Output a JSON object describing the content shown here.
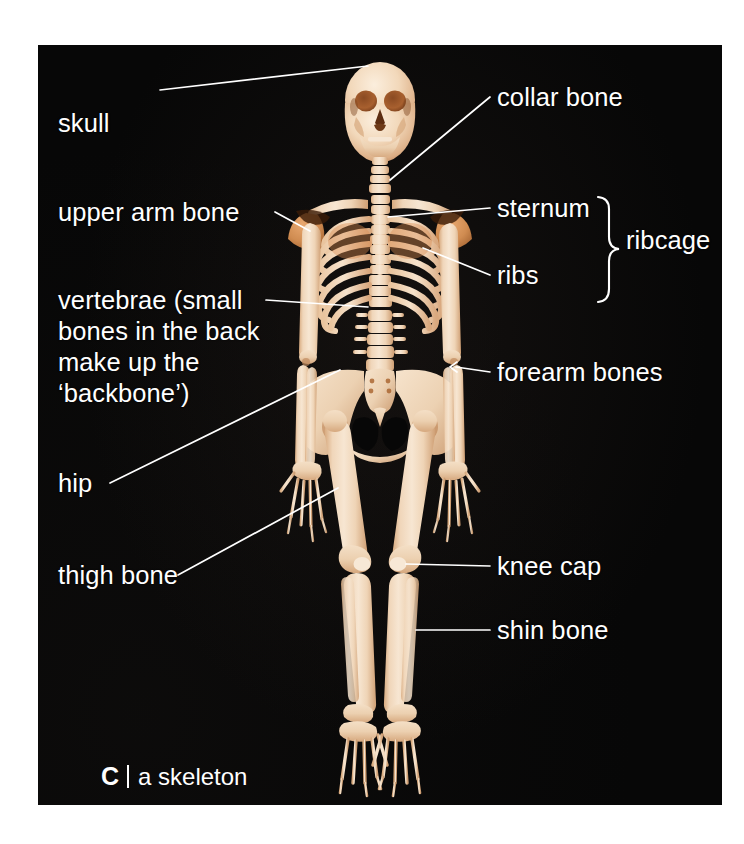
{
  "figure": {
    "kind": "anatomy-photo-diagram",
    "panel_background": "#070707",
    "label_color": "#ffffff",
    "bone_color": "#f2d9bd",
    "bone_shadow_color": "#c08a5e",
    "caption": {
      "letter": "C",
      "separator": "|",
      "text": "a skeleton"
    }
  },
  "labels": {
    "skull": "skull",
    "upper_arm_bone": "upper arm bone",
    "vertebrae": "vertebrae (small bones in the back make up the ‘backbone’)",
    "hip": "hip",
    "thigh_bone": "thigh bone",
    "collar_bone": "collar bone",
    "sternum": "sternum",
    "ribs": "ribs",
    "ribcage": "ribcage",
    "forearm_bones": "forearm bones",
    "knee_cap": "knee cap",
    "shin_bone": "shin bone"
  },
  "annotations": [
    {
      "id": "skull",
      "label": "skull",
      "side": "left",
      "x": 58,
      "y": 78,
      "target_x": 367,
      "target_y": 60
    },
    {
      "id": "upper-arm-bone",
      "label": "upper arm bone",
      "side": "left",
      "x": 58,
      "y": 200,
      "target_x": 305,
      "target_y": 227
    },
    {
      "id": "vertebrae",
      "label": "vertebrae (small bones in the back make up the ‘backbone’)",
      "side": "left",
      "x": 58,
      "y": 287,
      "target_x": 360,
      "target_y": 300
    },
    {
      "id": "hip",
      "label": "hip",
      "side": "left",
      "x": 58,
      "y": 478,
      "target_x": 345,
      "target_y": 368
    },
    {
      "id": "thigh-bone",
      "label": "thigh bone",
      "side": "left",
      "x": 58,
      "y": 570,
      "target_x": 337,
      "target_y": 485
    },
    {
      "id": "collar-bone",
      "label": "collar bone",
      "side": "right",
      "x": 497,
      "y": 85,
      "target_x": 383,
      "target_y": 170
    },
    {
      "id": "sternum",
      "label": "sternum",
      "side": "right",
      "x": 497,
      "y": 196,
      "target_x": 390,
      "target_y": 212
    },
    {
      "id": "ribs",
      "label": "ribs",
      "side": "right",
      "x": 497,
      "y": 263,
      "target_x": 419,
      "target_y": 236
    },
    {
      "id": "ribcage",
      "label": "ribcage",
      "side": "right",
      "x": 626,
      "y": 228,
      "target_x": 0,
      "target_y": 0
    },
    {
      "id": "forearm-bones",
      "label": "forearm bones",
      "side": "right",
      "x": 497,
      "y": 360,
      "target_x": 454,
      "target_y": 365
    },
    {
      "id": "knee-cap",
      "label": "knee cap",
      "side": "right",
      "x": 497,
      "y": 554,
      "target_x": 420,
      "target_y": 562
    },
    {
      "id": "shin-bone",
      "label": "shin bone",
      "side": "right",
      "x": 497,
      "y": 618,
      "target_x": 418,
      "target_y": 620
    }
  ],
  "brace": {
    "name": "ribcage-brace",
    "top_label": "sternum",
    "bottom_label": "ribs",
    "group_label": "ribcage"
  }
}
